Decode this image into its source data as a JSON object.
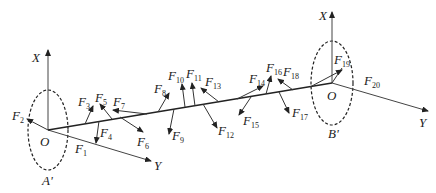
{
  "diagram": {
    "type": "shaft force diagram",
    "left_frame": {
      "origin_label": "O",
      "x_axis_label": "X",
      "y_axis_label": "Y",
      "section_label": "A'"
    },
    "right_frame": {
      "origin_label": "O",
      "x_axis_label": "X",
      "y_axis_label": "Y",
      "section_label": "B'"
    },
    "forces": [
      {
        "base": "F",
        "sub": "1"
      },
      {
        "base": "F",
        "sub": "2"
      },
      {
        "base": "F",
        "sub": "3"
      },
      {
        "base": "F",
        "sub": "4"
      },
      {
        "base": "F",
        "sub": "5"
      },
      {
        "base": "F",
        "sub": "6"
      },
      {
        "base": "F",
        "sub": "7"
      },
      {
        "base": "F",
        "sub": "8"
      },
      {
        "base": "F",
        "sub": "9"
      },
      {
        "base": "F",
        "sub": "10"
      },
      {
        "base": "F",
        "sub": "11"
      },
      {
        "base": "F",
        "sub": "12"
      },
      {
        "base": "F",
        "sub": "13"
      },
      {
        "base": "F",
        "sub": "14"
      },
      {
        "base": "F",
        "sub": "15"
      },
      {
        "base": "F",
        "sub": "16"
      },
      {
        "base": "F",
        "sub": "17"
      },
      {
        "base": "F",
        "sub": "18"
      },
      {
        "base": "F",
        "sub": "19"
      },
      {
        "base": "F",
        "sub": "20"
      }
    ]
  }
}
